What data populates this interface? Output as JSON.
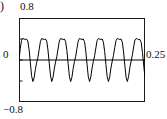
{
  "figure": {
    "panel_label": ")",
    "y_top_label": "0.8",
    "y_zero_label": "0",
    "y_bottom_label": "−0.8",
    "x_right_label": "0.25",
    "frame_color": "#1a1a1a",
    "curve_color": "#000000"
  },
  "chart_data": {
    "type": "line",
    "title": "",
    "xlabel": "",
    "ylabel": "",
    "xlim": [
      0,
      0.25
    ],
    "ylim": [
      -0.8,
      0.8
    ],
    "grid": false,
    "legend": null,
    "axis_tick_labels": {
      "y": [
        "0.8",
        "0",
        "−0.8"
      ],
      "x": [
        "0.25"
      ]
    },
    "cycles": 11,
    "amplitude": 0.4,
    "zero_line": 0,
    "series": [
      {
        "name": "signal",
        "x": [
          0,
          0.0025,
          0.005,
          0.0075,
          0.01,
          0.0125,
          0.015,
          0.0175,
          0.02,
          0.0225,
          0.025,
          0.0275,
          0.03,
          0.0325,
          0.035,
          0.0375,
          0.04,
          0.0425,
          0.045,
          0.0475,
          0.05,
          0.0525,
          0.055,
          0.0575,
          0.06,
          0.0625,
          0.065,
          0.0675,
          0.07,
          0.0725,
          0.075,
          0.0775,
          0.08,
          0.0825,
          0.085,
          0.0875,
          0.09,
          0.0925,
          0.095,
          0.0975,
          0.1,
          0.1025,
          0.105,
          0.1075,
          0.11,
          0.1125,
          0.115,
          0.1175,
          0.12,
          0.1225,
          0.125,
          0.1275,
          0.13,
          0.1325,
          0.135,
          0.1375,
          0.14,
          0.1425,
          0.145,
          0.1475,
          0.15,
          0.1525,
          0.155,
          0.1575,
          0.16,
          0.1625,
          0.165,
          0.1675,
          0.17,
          0.1725,
          0.175,
          0.1775,
          0.18,
          0.1825,
          0.185,
          0.1875,
          0.19,
          0.1925,
          0.195,
          0.1975,
          0.2,
          0.2025,
          0.205,
          0.2075,
          0.21,
          0.2125,
          0.215,
          0.2175,
          0.22,
          0.2225,
          0.225,
          0.2275,
          0.23,
          0.2325,
          0.235,
          0.2375,
          0.24,
          0.2425,
          0.245,
          0.2475,
          0.25
        ],
        "values": [
          0.0,
          0.22,
          0.37,
          0.41,
          0.4,
          0.39,
          0.4,
          0.36,
          0.2,
          -0.05,
          -0.3,
          -0.41,
          -0.34,
          -0.18,
          -0.05,
          0.05,
          0.2,
          0.35,
          0.41,
          0.4,
          0.39,
          0.4,
          0.36,
          0.19,
          -0.06,
          -0.3,
          -0.41,
          -0.33,
          -0.17,
          -0.04,
          0.06,
          0.21,
          0.36,
          0.41,
          0.4,
          0.39,
          0.4,
          0.35,
          0.18,
          -0.07,
          -0.31,
          -0.41,
          -0.33,
          -0.16,
          -0.03,
          0.07,
          0.22,
          0.36,
          0.41,
          0.4,
          0.39,
          0.4,
          0.35,
          0.17,
          -0.08,
          -0.32,
          -0.41,
          -0.32,
          -0.15,
          -0.03,
          0.08,
          0.23,
          0.37,
          0.41,
          0.4,
          0.39,
          0.4,
          0.34,
          0.16,
          -0.09,
          -0.32,
          -0.41,
          -0.32,
          -0.15,
          -0.02,
          0.09,
          0.24,
          0.37,
          0.41,
          0.4,
          0.39,
          0.4,
          0.34,
          0.15,
          -0.1,
          -0.33,
          -0.41,
          -0.31,
          -0.14,
          -0.02,
          0.1,
          0.25,
          0.38,
          0.41,
          0.4,
          0.39,
          0.39,
          0.33,
          0.14,
          -0.11,
          -0.33
        ]
      }
    ]
  }
}
